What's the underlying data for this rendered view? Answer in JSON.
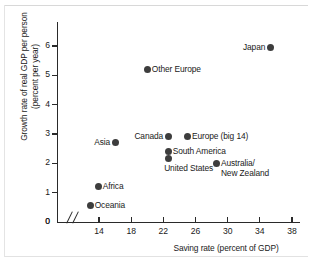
{
  "chart_data": {
    "type": "scatter",
    "title": "",
    "xlabel": "Saving rate (percent of GDP)",
    "ylabel": "Growth rate of real GDP per person\n(percent per year)",
    "xlim": [
      14,
      38
    ],
    "ylim": [
      0,
      6.5
    ],
    "x_ticks": [
      "14",
      "18",
      "22",
      "26",
      "30",
      "34",
      "38"
    ],
    "x_tick_values": [
      14,
      18,
      22,
      26,
      30,
      34,
      38
    ],
    "y_ticks": [
      "0",
      "1",
      "2",
      "3",
      "4",
      "5",
      "6"
    ],
    "y_tick_values": [
      0,
      1,
      2,
      3,
      4,
      5,
      6
    ],
    "y_origin_label": "0",
    "axis_break": true,
    "grid": false,
    "legend": "none",
    "marker_color": "#3d3d3d",
    "axis_color": "#2a2a2a",
    "points": [
      {
        "label": "Japan",
        "x": 35.3,
        "y": 5.95,
        "label_side": "left"
      },
      {
        "label": "Other Europe",
        "x": 20.0,
        "y": 5.2,
        "label_side": "right"
      },
      {
        "label": "Canada",
        "x": 22.6,
        "y": 2.9,
        "label_side": "left"
      },
      {
        "label": "Europe (big 14)",
        "x": 25.0,
        "y": 2.9,
        "label_side": "right"
      },
      {
        "label": "Asia",
        "x": 16.0,
        "y": 2.7,
        "label_side": "left"
      },
      {
        "label": "South America",
        "x": 22.6,
        "y": 2.4,
        "label_side": "right"
      },
      {
        "label": "United States",
        "x": 22.6,
        "y": 2.15,
        "label_side": "below"
      },
      {
        "label": "Australia/\nNew Zealand",
        "x": 28.6,
        "y": 2.0,
        "label_side": "right"
      },
      {
        "label": "Africa",
        "x": 13.9,
        "y": 1.2,
        "label_side": "right"
      },
      {
        "label": "Oceania",
        "x": 12.9,
        "y": 0.55,
        "label_side": "right"
      }
    ]
  }
}
